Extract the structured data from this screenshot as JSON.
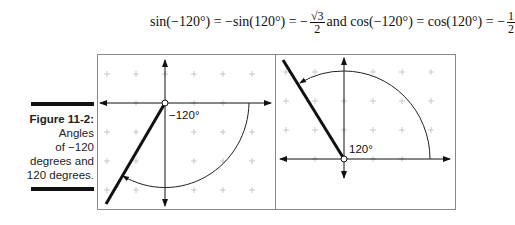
{
  "equation": {
    "part1": "sin(−120°) = −sin(120°) = −",
    "frac1_num": "√3",
    "frac1_den": "2",
    "connector": " and cos(−120°) = cos(120°) = −",
    "frac2_num": "1",
    "frac2_den": "2"
  },
  "caption": {
    "label": "Figure 11-2:",
    "line1": "Angles",
    "line2": "of −120",
    "line3": "degrees and",
    "line4": "120 degrees."
  },
  "panels": [
    {
      "name": "negative-angle",
      "angle_label": "−120°",
      "angle_deg": -120
    },
    {
      "name": "positive-angle",
      "angle_label": "120°",
      "angle_deg": 120
    }
  ],
  "colors": {
    "ink": "#111111",
    "grid": "#bbbbbb",
    "frame": "#888888"
  }
}
